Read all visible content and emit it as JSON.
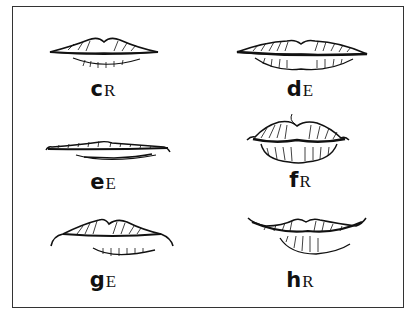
{
  "figure": {
    "panels": [
      {
        "id": "c",
        "letter": "c",
        "suffix": "R",
        "shape": "thin-smile"
      },
      {
        "id": "d",
        "letter": "d",
        "suffix": "E",
        "shape": "wide-full"
      },
      {
        "id": "e",
        "letter": "e",
        "suffix": "E",
        "shape": "very-thin"
      },
      {
        "id": "f",
        "letter": "f",
        "suffix": "R",
        "shape": "full-pouty"
      },
      {
        "id": "g",
        "letter": "g",
        "suffix": "E",
        "shape": "downturned-corners"
      },
      {
        "id": "h",
        "letter": "h",
        "suffix": "R",
        "shape": "upturned-wide"
      }
    ]
  },
  "colors": {
    "ink": "#111111",
    "background": "#ffffff",
    "border": "#333333"
  }
}
